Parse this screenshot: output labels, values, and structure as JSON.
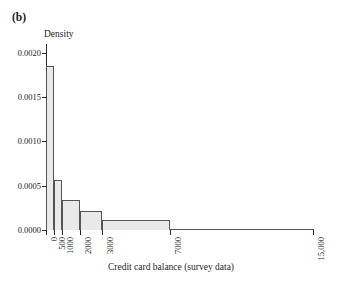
{
  "panel": {
    "label": "(b)"
  },
  "axes": {
    "ylabel": "Density",
    "xlabel": "Credit card balance (survey data)",
    "yticks": [
      "0.0000",
      "0.0005",
      "0.0010",
      "0.0015",
      "0.0020"
    ],
    "xticks": [
      "0",
      "500",
      "1000",
      "2000",
      "3000",
      "7000",
      "15,000"
    ]
  },
  "colors": {
    "bar_fill": "#e9e9e9",
    "bar_edge": "#555555",
    "axis": "#2b2b2b",
    "text": "#1a1a1a",
    "background": "#ffffff"
  },
  "chart_data": {
    "type": "bar",
    "title": "(b)",
    "xlabel": "Credit card balance (survey data)",
    "ylabel": "Density",
    "ylim": [
      0.0,
      0.0021
    ],
    "yticks": [
      0.0,
      0.0005,
      0.001,
      0.0015,
      0.002
    ],
    "xlim": [
      0,
      16000
    ],
    "xticks": [
      0,
      500,
      1000,
      2000,
      3000,
      7000,
      15000
    ],
    "grid": false,
    "legend": null,
    "note": "Histogram of credit card balances with unequal bin widths; bar heights are densities so area equals relative frequency.",
    "bins": [
      {
        "x_start": 0,
        "x_end": 500,
        "density": 0.00185
      },
      {
        "x_start": 500,
        "x_end": 1000,
        "density": 0.00056
      },
      {
        "x_start": 1000,
        "x_end": 2000,
        "density": 0.00034
      },
      {
        "x_start": 2000,
        "x_end": 3000,
        "density": 0.00021
      },
      {
        "x_start": 3000,
        "x_end": 7000,
        "density": 0.00011
      },
      {
        "x_start": 7000,
        "x_end": 15000,
        "density": 1e-05
      }
    ],
    "categories": [
      "0-500",
      "500-1000",
      "1000-2000",
      "2000-3000",
      "3000-7000",
      "7000-15000"
    ],
    "values": [
      0.00185,
      0.00056,
      0.00034,
      0.00021,
      0.00011,
      1e-05
    ]
  }
}
